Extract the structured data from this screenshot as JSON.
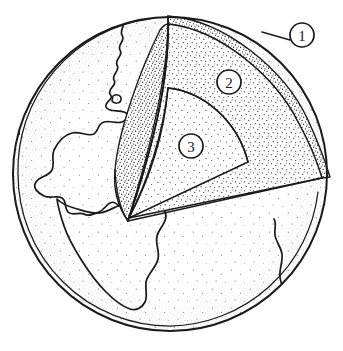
{
  "figure": {
    "style": "hand-drawn pen-and-ink stipple illustration",
    "background_color": "#ffffff",
    "ink_color": "#1a1a1a",
    "stipple_color": "#33333 3"
  },
  "globe": {
    "name": "earth-sphere",
    "center_x": 170,
    "center_y": 174,
    "radius": 157,
    "outline_color": "#1a1a1a"
  },
  "labels": [
    {
      "id": "1",
      "text": "1",
      "name": "callout-label-1",
      "target": "outer-shell-crust",
      "cx": 302,
      "cy": 35,
      "r": 12,
      "leader_from_x": 290,
      "leader_from_y": 40,
      "leader_to_x": 262,
      "leader_to_y": 32
    },
    {
      "id": "2",
      "text": "2",
      "name": "callout-label-2",
      "target": "mantle-layer",
      "cx": 229,
      "cy": 82,
      "r": 12,
      "leader_from_x": null,
      "leader_from_y": null,
      "leader_to_x": null,
      "leader_to_y": null
    },
    {
      "id": "3",
      "text": "3",
      "name": "callout-label-3",
      "target": "core-layer",
      "cx": 191,
      "cy": 146,
      "r": 12,
      "leader_from_x": null,
      "leader_from_y": null,
      "leader_to_x": null,
      "leader_to_y": null
    }
  ],
  "regions": {
    "crust_shell": {
      "name": "outer-shell-crust",
      "description": "narrow stippled rim around the globe, target of label 1",
      "stipple_density": "dense"
    },
    "mantle_cut": {
      "name": "mantle-cut-face",
      "description": "broad stippled wedge face between the crust rim and the core arc, labelled 2",
      "stipple_density": "medium"
    },
    "core_cut": {
      "name": "core-cut-face",
      "description": "inner quarter-round wedge at the globe centre, labelled 3",
      "stipple_density": "light"
    },
    "globe_surface": {
      "name": "globe-surface",
      "description": "remaining sphere surface showing North and South America coastlines with light stipple shading toward the limb",
      "stipple_density": "graded"
    }
  },
  "geography": {
    "visible_landmasses": [
      "North America",
      "South America",
      "Africa (west coast sliver)"
    ]
  }
}
